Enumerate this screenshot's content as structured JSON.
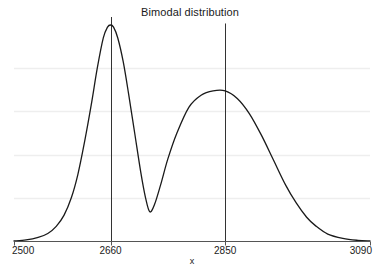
{
  "chart_data": {
    "type": "line",
    "title": "Bimodal distribution",
    "xlabel": "x",
    "ylabel": "",
    "xlim": [
      2500,
      3090
    ],
    "ylim": [
      0,
      1.0
    ],
    "grid": true,
    "legend": null,
    "xticks": [
      2500,
      2660,
      2850,
      3090
    ],
    "xtick_labels": [
      "2500",
      "2660",
      "2850",
      "3090"
    ],
    "yticks": [],
    "ytick_labels": [],
    "gridlines_y": [
      0.2,
      0.4,
      0.6,
      0.8
    ],
    "annotations": [
      {
        "type": "vline",
        "x": 2660,
        "label": "2660",
        "top_value": 1.0
      },
      {
        "type": "vline",
        "x": 2850,
        "label": "2850",
        "top_value": 0.97
      }
    ],
    "series": [
      {
        "name": "density",
        "description": "Bimodal density: tall narrow mode at 2660, lower broader mode at 2850",
        "peaks": [
          {
            "x": 2660,
            "y": 1.0
          },
          {
            "x": 2850,
            "y": 0.695
          }
        ],
        "valley": {
          "x": 2725,
          "y": 0.135
        },
        "x": [
          2500,
          2520,
          2540,
          2556,
          2570,
          2583,
          2595,
          2606,
          2617,
          2628,
          2638,
          2648,
          2655,
          2660,
          2665,
          2672,
          2681,
          2690,
          2700,
          2710,
          2718,
          2725,
          2733,
          2743,
          2755,
          2770,
          2790,
          2810,
          2830,
          2850,
          2870,
          2890,
          2910,
          2930,
          2950,
          2968,
          2985,
          3000,
          3020,
          3045,
          3070,
          3090
        ],
        "y": [
          0.0,
          0.005,
          0.017,
          0.035,
          0.068,
          0.12,
          0.2,
          0.31,
          0.46,
          0.63,
          0.8,
          0.94,
          0.99,
          1.0,
          0.99,
          0.94,
          0.83,
          0.68,
          0.5,
          0.32,
          0.2,
          0.135,
          0.17,
          0.26,
          0.38,
          0.5,
          0.62,
          0.675,
          0.695,
          0.695,
          0.66,
          0.59,
          0.49,
          0.375,
          0.26,
          0.175,
          0.11,
          0.07,
          0.032,
          0.012,
          0.003,
          0.0
        ]
      }
    ],
    "colors": {
      "curve": "#1a1a1a",
      "grid": "#eeeeee",
      "axis": "#555555",
      "vline": "#333333",
      "background": "#ffffff"
    }
  }
}
